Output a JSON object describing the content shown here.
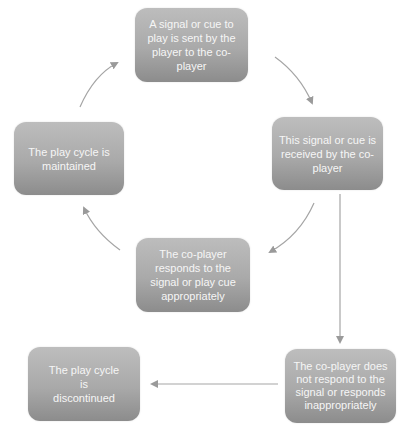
{
  "diagram": {
    "type": "cycle-flowchart",
    "colors": {
      "box_top": "#bdbdbd",
      "box_bottom": "#8c8c8c",
      "box_text": "#f6f6f6",
      "arrow": "#9a9a9a",
      "background": "#ffffff"
    },
    "nodes": [
      {
        "id": "signal-sent",
        "label": "A signal or cue to play is sent by the player to the co-player"
      },
      {
        "id": "signal-received",
        "label": "This signal or cue is received by the co-player"
      },
      {
        "id": "responds-appropriately",
        "label": "The co-player responds to the signal or play cue appropriately"
      },
      {
        "id": "cycle-maintained",
        "label": "The play cycle is maintained"
      },
      {
        "id": "does-not-respond",
        "label": "The co-player does not respond to the signal or responds inappropriately"
      },
      {
        "id": "cycle-discontinued",
        "label": "The play cycle is discontinued"
      }
    ],
    "edges": [
      {
        "from": "signal-sent",
        "to": "signal-received",
        "style": "curved"
      },
      {
        "from": "signal-received",
        "to": "responds-appropriately",
        "style": "curved"
      },
      {
        "from": "responds-appropriately",
        "to": "cycle-maintained",
        "style": "curved"
      },
      {
        "from": "cycle-maintained",
        "to": "signal-sent",
        "style": "curved"
      },
      {
        "from": "signal-received",
        "to": "does-not-respond",
        "style": "straight"
      },
      {
        "from": "does-not-respond",
        "to": "cycle-discontinued",
        "style": "straight"
      }
    ]
  }
}
